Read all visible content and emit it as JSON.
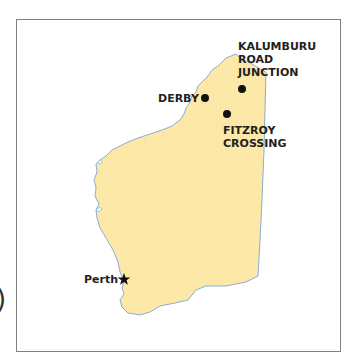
{
  "map": {
    "region": "Western Australia",
    "colors": {
      "land": "#fde9a9",
      "coast": "#8aaed6",
      "frame": "#808080",
      "marker": "#111111",
      "text": "#231f20"
    },
    "places": [
      {
        "name": "KALUMBURU ROAD JUNCTION",
        "lines": [
          "KALUMBURU",
          "ROAD",
          "JUNCTION"
        ],
        "marker": "dot"
      },
      {
        "name": "DERBY",
        "lines": [
          "DERBY"
        ],
        "marker": "dot"
      },
      {
        "name": "FITZROY CROSSING",
        "lines": [
          "FITZROY",
          "CROSSING"
        ],
        "marker": "dot"
      },
      {
        "name": "Perth",
        "lines": [
          "Perth"
        ],
        "marker": "star"
      }
    ]
  },
  "edge_fragment": ")"
}
